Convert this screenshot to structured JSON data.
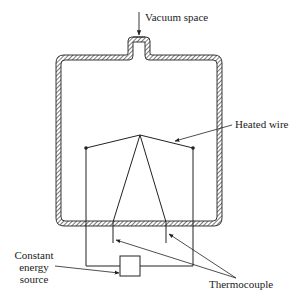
{
  "diagram": {
    "labels": {
      "vacuum_space": "Vacuum space",
      "heated_wire": "Heated wire",
      "energy_source_line1": "Constant",
      "energy_source_line2": "energy",
      "energy_source_line3": "source",
      "thermocouple": "Thermocouple"
    },
    "components": [
      {
        "id": "vessel",
        "type": "hatched-wall container with neck"
      },
      {
        "id": "heated-wire",
        "type": "wire between two posts, peaked at center"
      },
      {
        "id": "thermocouple",
        "type": "two leads from wire apex through vessel bottom"
      },
      {
        "id": "energy-source",
        "type": "box connected to wire supports"
      }
    ],
    "colors": {
      "line": "#222222",
      "hatch": "#555555",
      "background": "#ffffff"
    }
  }
}
